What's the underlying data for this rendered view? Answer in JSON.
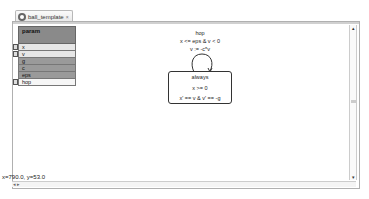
{
  "tab": {
    "icon": "automaton-icon",
    "label": "ball_template",
    "close": "×"
  },
  "palette": {
    "header": "param",
    "items": [
      {
        "label": "x",
        "style": "light",
        "marker": true
      },
      {
        "label": "v",
        "style": "light",
        "marker": true
      },
      {
        "label": "g",
        "style": "dark",
        "marker": false
      },
      {
        "label": "c",
        "style": "dark",
        "marker": false
      },
      {
        "label": "eps",
        "style": "dark",
        "marker": false
      },
      {
        "label": "hop",
        "style": "white",
        "marker": true
      }
    ]
  },
  "diagram": {
    "transition": {
      "name": "hop",
      "guard": "x <= eps & v < 0",
      "reset": "v := -c*v"
    },
    "location": {
      "name": "always",
      "invariant": "x >= 0",
      "flow": "x' == v & v' == -g"
    }
  },
  "status": {
    "coords": "x=790.0, y=53.0"
  },
  "scrollbars": {
    "up": "▴",
    "down": "▾",
    "h_arrows": "◂ ▸"
  }
}
